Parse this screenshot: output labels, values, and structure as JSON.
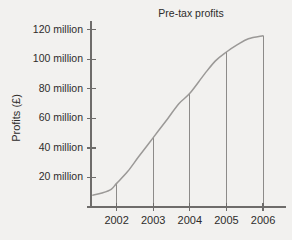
{
  "chart_data": {
    "type": "line",
    "title": "Pre-tax profits",
    "xlabel": "",
    "ylabel": "Profits (£)",
    "x": [
      2002,
      2003,
      2004,
      2005,
      2006
    ],
    "categories": [
      "2002",
      "2003",
      "2004",
      "2005",
      "2006"
    ],
    "values": [
      16,
      47,
      77,
      105,
      116
    ],
    "value_units": "million",
    "ylim": [
      0,
      126
    ],
    "xlim": [
      2001.3,
      2006.6
    ],
    "yticks": [
      20,
      40,
      60,
      80,
      100,
      120
    ],
    "ytick_labels": [
      "20 million",
      "40 million",
      "60 million",
      "80 million",
      "100 million",
      "120 million"
    ],
    "xtick_labels": [
      "2002",
      "2003",
      "2004",
      "2005",
      "2006"
    ],
    "grid": false,
    "legend": false,
    "legend_position": "none",
    "series": [
      {
        "name": "Pre-tax profits",
        "values": [
          16,
          47,
          77,
          105,
          116
        ]
      }
    ],
    "drop_lines": true,
    "curve_shape": "s-curve",
    "curve_points": [
      {
        "x": 2001.35,
        "y": 8
      },
      {
        "x": 2001.6,
        "y": 9.5
      },
      {
        "x": 2001.85,
        "y": 12
      },
      {
        "x": 2002,
        "y": 16
      },
      {
        "x": 2002.3,
        "y": 24
      },
      {
        "x": 2002.6,
        "y": 34
      },
      {
        "x": 2003,
        "y": 47
      },
      {
        "x": 2003.4,
        "y": 60
      },
      {
        "x": 2003.7,
        "y": 70
      },
      {
        "x": 2004,
        "y": 77
      },
      {
        "x": 2004.4,
        "y": 90
      },
      {
        "x": 2004.7,
        "y": 99
      },
      {
        "x": 2005,
        "y": 105
      },
      {
        "x": 2005.3,
        "y": 110
      },
      {
        "x": 2005.6,
        "y": 114
      },
      {
        "x": 2006,
        "y": 116
      }
    ],
    "colors": {
      "background": "#f2f1ef",
      "axis": "#6e6c6a",
      "curve": "#9b9997",
      "drop_line": "#8d8b89",
      "text": "#2e2c2b"
    }
  }
}
